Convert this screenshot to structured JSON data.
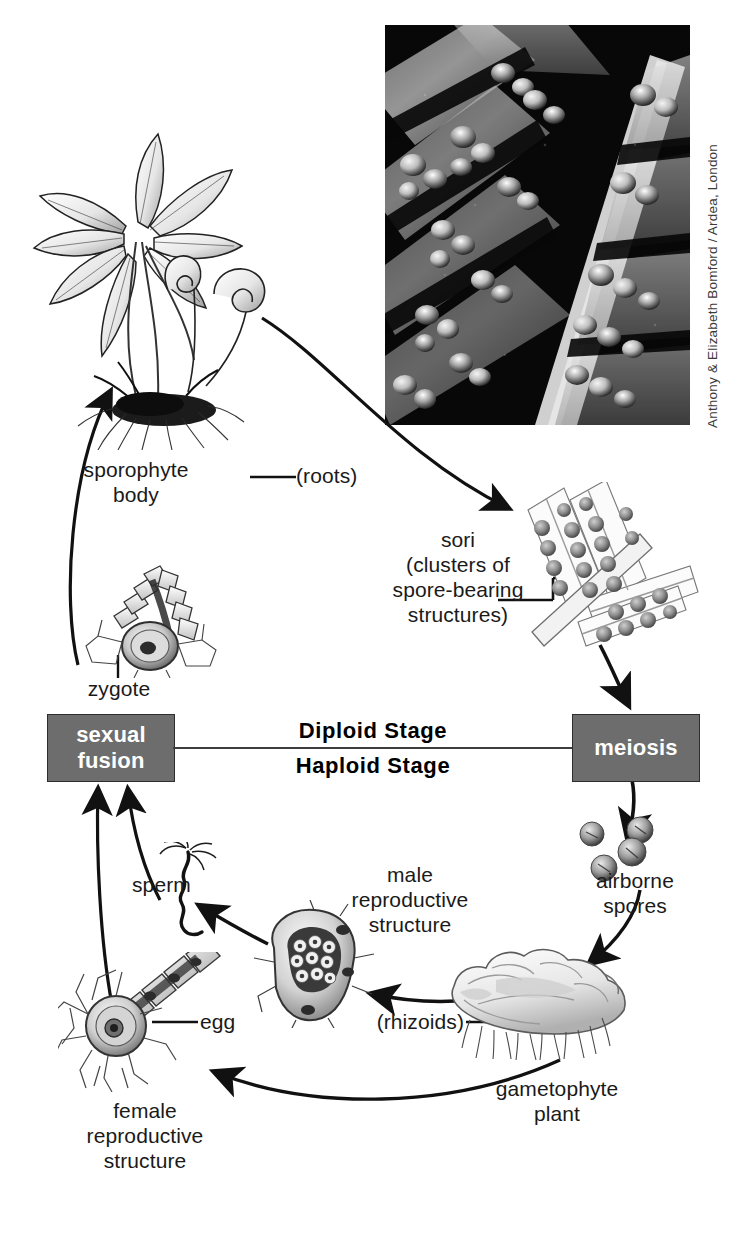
{
  "photo": {
    "alt_name": "fern-frond-sori-photograph",
    "credit": "Anthony & Elizabeth Bomford / Ardea, London"
  },
  "stage_labels": {
    "diploid": "Diploid Stage",
    "haploid": "Haploid Stage"
  },
  "boxes": {
    "sexual_fusion": "sexual\nfusion",
    "meiosis": "meiosis"
  },
  "labels": {
    "sporophyte_body": "sporophyte\nbody",
    "roots": "(roots)",
    "sori": "sori\n(clusters of\nspore-bearing\nstructures)",
    "zygote": "zygote",
    "airborne_spores": "airborne\nspores",
    "sperm": "sperm",
    "male_reproductive": "male\nreproductive\nstructure",
    "egg": "egg",
    "female_reproductive": "female\nreproductive\nstructure",
    "rhizoids": "(rhizoids)",
    "gametophyte_plant": "gametophyte\nplant"
  },
  "colors": {
    "box_fill": "#6d6d6d",
    "box_text": "#ffffff",
    "ink": "#1a1a1a",
    "divider": "#3d3d3d",
    "page": "#ffffff"
  }
}
